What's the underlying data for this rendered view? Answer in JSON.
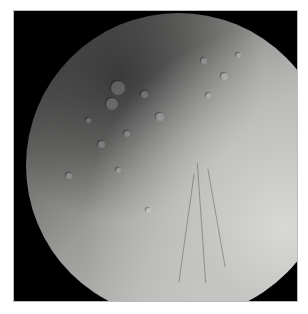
{
  "image": {
    "subject": "cratered icy moon",
    "background_color": "#000000",
    "surface_color_dark": "#2a2a2a",
    "surface_color_light": "#d6d6d4",
    "border_color": "#ffffff"
  }
}
